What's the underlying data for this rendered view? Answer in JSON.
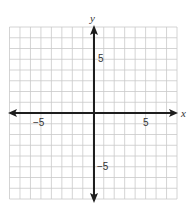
{
  "chart_data": {
    "type": "coordinate-plane",
    "title": "",
    "xlabel": "x",
    "ylabel": "y",
    "xlim": [
      -8,
      8
    ],
    "ylim": [
      -8,
      8
    ],
    "grid": true,
    "grid_step": 1,
    "tick_labels": {
      "x": [
        {
          "value": -5,
          "label": "−5"
        },
        {
          "value": 5,
          "label": "5"
        }
      ],
      "y": [
        {
          "value": 5,
          "label": "5"
        },
        {
          "value": -5,
          "label": "−5"
        }
      ]
    },
    "series": []
  },
  "colors": {
    "grid": "#c9c9c9",
    "axis": "#1e1e1e",
    "text": "#333333"
  },
  "labels": {
    "x_axis": "x",
    "y_axis": "y",
    "x_neg5": "−5",
    "x_pos5": "5",
    "y_pos5": "5",
    "y_neg5": "−5"
  }
}
